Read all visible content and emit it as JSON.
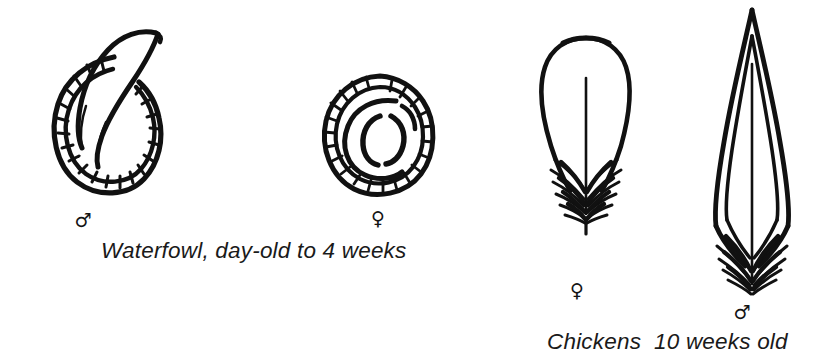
{
  "figure": {
    "background_color": "#ffffff",
    "ink_color": "#111111",
    "width": 819,
    "height": 361
  },
  "panels": [
    {
      "id": "waterfowl",
      "caption": "Waterfowl, day-old to 4 weeks",
      "specimens": [
        {
          "id": "waterfowl-male",
          "sex": "male",
          "symbol": "♂",
          "symbol_name": "mars-symbol",
          "description": "Vent with everted phallus"
        },
        {
          "id": "waterfowl-female",
          "sex": "female",
          "symbol": "♀",
          "symbol_name": "venus-symbol",
          "description": "Vent with concentric folds"
        }
      ]
    },
    {
      "id": "chickens",
      "caption": "Chickens  10 weeks old",
      "specimens": [
        {
          "id": "chicken-female",
          "sex": "female",
          "symbol": "♀",
          "symbol_name": "venus-symbol",
          "description": "Rounded hackle feather"
        },
        {
          "id": "chicken-male",
          "sex": "male",
          "symbol": "♂",
          "symbol_name": "mars-symbol",
          "description": "Pointed hackle feather"
        }
      ]
    }
  ]
}
